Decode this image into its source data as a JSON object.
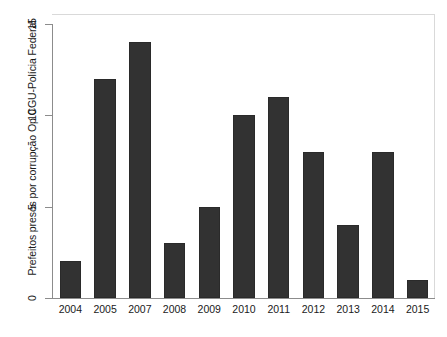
{
  "chart_data": {
    "type": "bar",
    "title": "",
    "subtitle": "",
    "xlabel": "",
    "ylabel": "Prefeitos presos por corrupção Op CGU-Polícia Federal",
    "categories": [
      "2004",
      "2005",
      "2007",
      "2008",
      "2009",
      "2010",
      "2011",
      "2012",
      "2013",
      "2014",
      "2015"
    ],
    "values": [
      2,
      12,
      14,
      3,
      5,
      10,
      11,
      8,
      4,
      8,
      1
    ],
    "ylim": [
      0,
      15
    ],
    "yticks": [
      0,
      5,
      10,
      15
    ],
    "ytick_labels": [
      "0",
      "5",
      "10",
      "15"
    ],
    "grid": false,
    "legend": null,
    "bar_color": "#323232",
    "axis_color": "#8c8c8c",
    "frame_color": "#d9d9d9",
    "background": "#ffffff"
  }
}
